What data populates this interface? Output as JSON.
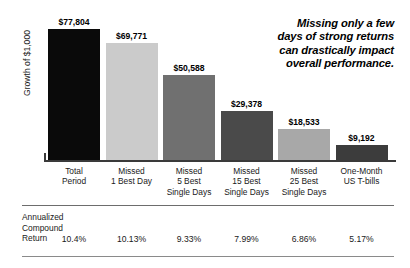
{
  "headline": {
    "lines": [
      "Missing only a few",
      "days of strong returns",
      "can drastically impact",
      "overall performance."
    ]
  },
  "axis": {
    "y_title": "Growth of $1,000"
  },
  "table": {
    "row_label_lines": [
      "Annualized",
      "Compound",
      "Return"
    ]
  },
  "chart_data": {
    "type": "bar",
    "title": "",
    "xlabel": "",
    "ylabel": "Growth of $1,000",
    "ylim": [
      0,
      77804
    ],
    "grid": false,
    "legend": "none",
    "categories": [
      "Total Period",
      "Missed 1 Best Day",
      "Missed 5 Best Single Days",
      "Missed 15 Best Single Days",
      "Missed 25 Best Single Days",
      "One-Month US T-bills"
    ],
    "category_label_lines": [
      [
        "Total",
        "Period"
      ],
      [
        "Missed",
        "1 Best Day"
      ],
      [
        "Missed",
        "5 Best",
        "Single Days"
      ],
      [
        "Missed",
        "15 Best",
        "Single Days"
      ],
      [
        "Missed",
        "25 Best",
        "Single Days"
      ],
      [
        "One-Month",
        "US T-bills"
      ]
    ],
    "values": [
      77804,
      69771,
      50588,
      29378,
      18533,
      9192
    ],
    "value_labels": [
      "$77,804",
      "$69,771",
      "$50,588",
      "$29,378",
      "$18,533",
      "$9,192"
    ],
    "bar_colors": [
      "#0a0a0a",
      "#cbcbcb",
      "#707070",
      "#4a4a4a",
      "#a8a8a8",
      "#3c3c3c"
    ],
    "annualized_compound_return": [
      "10.4%",
      "10.13%",
      "9.33%",
      "7.99%",
      "6.86%",
      "5.17%"
    ]
  }
}
